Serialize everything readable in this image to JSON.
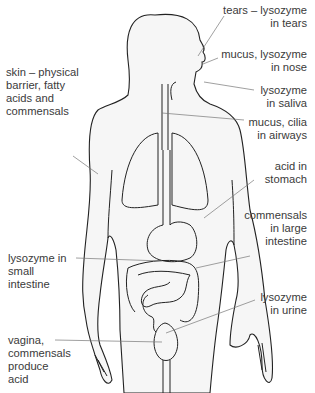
{
  "diagram": {
    "labels": {
      "tears": [
        "tears – lysozyme",
        "in tears"
      ],
      "nose": [
        "mucus, lysozyme",
        "in nose"
      ],
      "saliva": [
        "lysozyme",
        "in saliva"
      ],
      "airways": [
        "mucus, cilia",
        "in airways"
      ],
      "stomach": [
        "acid in",
        "stomach"
      ],
      "large_intestine": [
        "commensals",
        "in large",
        "intestine"
      ],
      "urine": [
        "lysozyme",
        "in urine"
      ],
      "skin": [
        "skin – physical",
        "barrier, fatty",
        "acids and",
        "commensals"
      ],
      "small_intestine": [
        "lysozyme in",
        "small",
        "intestine"
      ],
      "vagina": [
        "vagina,",
        "commensals",
        "produce",
        "acid"
      ]
    },
    "colors": {
      "outline": "#222222",
      "leader": "#666666",
      "text": "#3a3a3a",
      "fill": "#f7f7f7"
    }
  }
}
